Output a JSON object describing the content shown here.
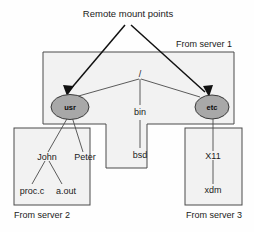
{
  "diagram": {
    "title_annotation": "Remote mount points",
    "server_labels": {
      "server1": "From server 1",
      "server2": "From server 2",
      "server3": "From server 3"
    },
    "nodes": {
      "root": "/",
      "usr": "usr",
      "etc": "etc",
      "bin": "bin",
      "bsd": "bsd",
      "john": "John",
      "peter": "Peter",
      "procc": "proc.c",
      "aout": "a.out",
      "x11": "X11",
      "xdm": "xdm"
    },
    "colors": {
      "box_fill": "#f2f2f2",
      "box_stroke": "#4a4a4a",
      "ellipse_fill": "#a8a8a8",
      "ellipse_stroke": "#3a3a3a",
      "tree_line": "#4a4a4a",
      "mount_arrow": "#111111",
      "text": "#1a1a1a",
      "page_bg": "#ffffff"
    }
  }
}
